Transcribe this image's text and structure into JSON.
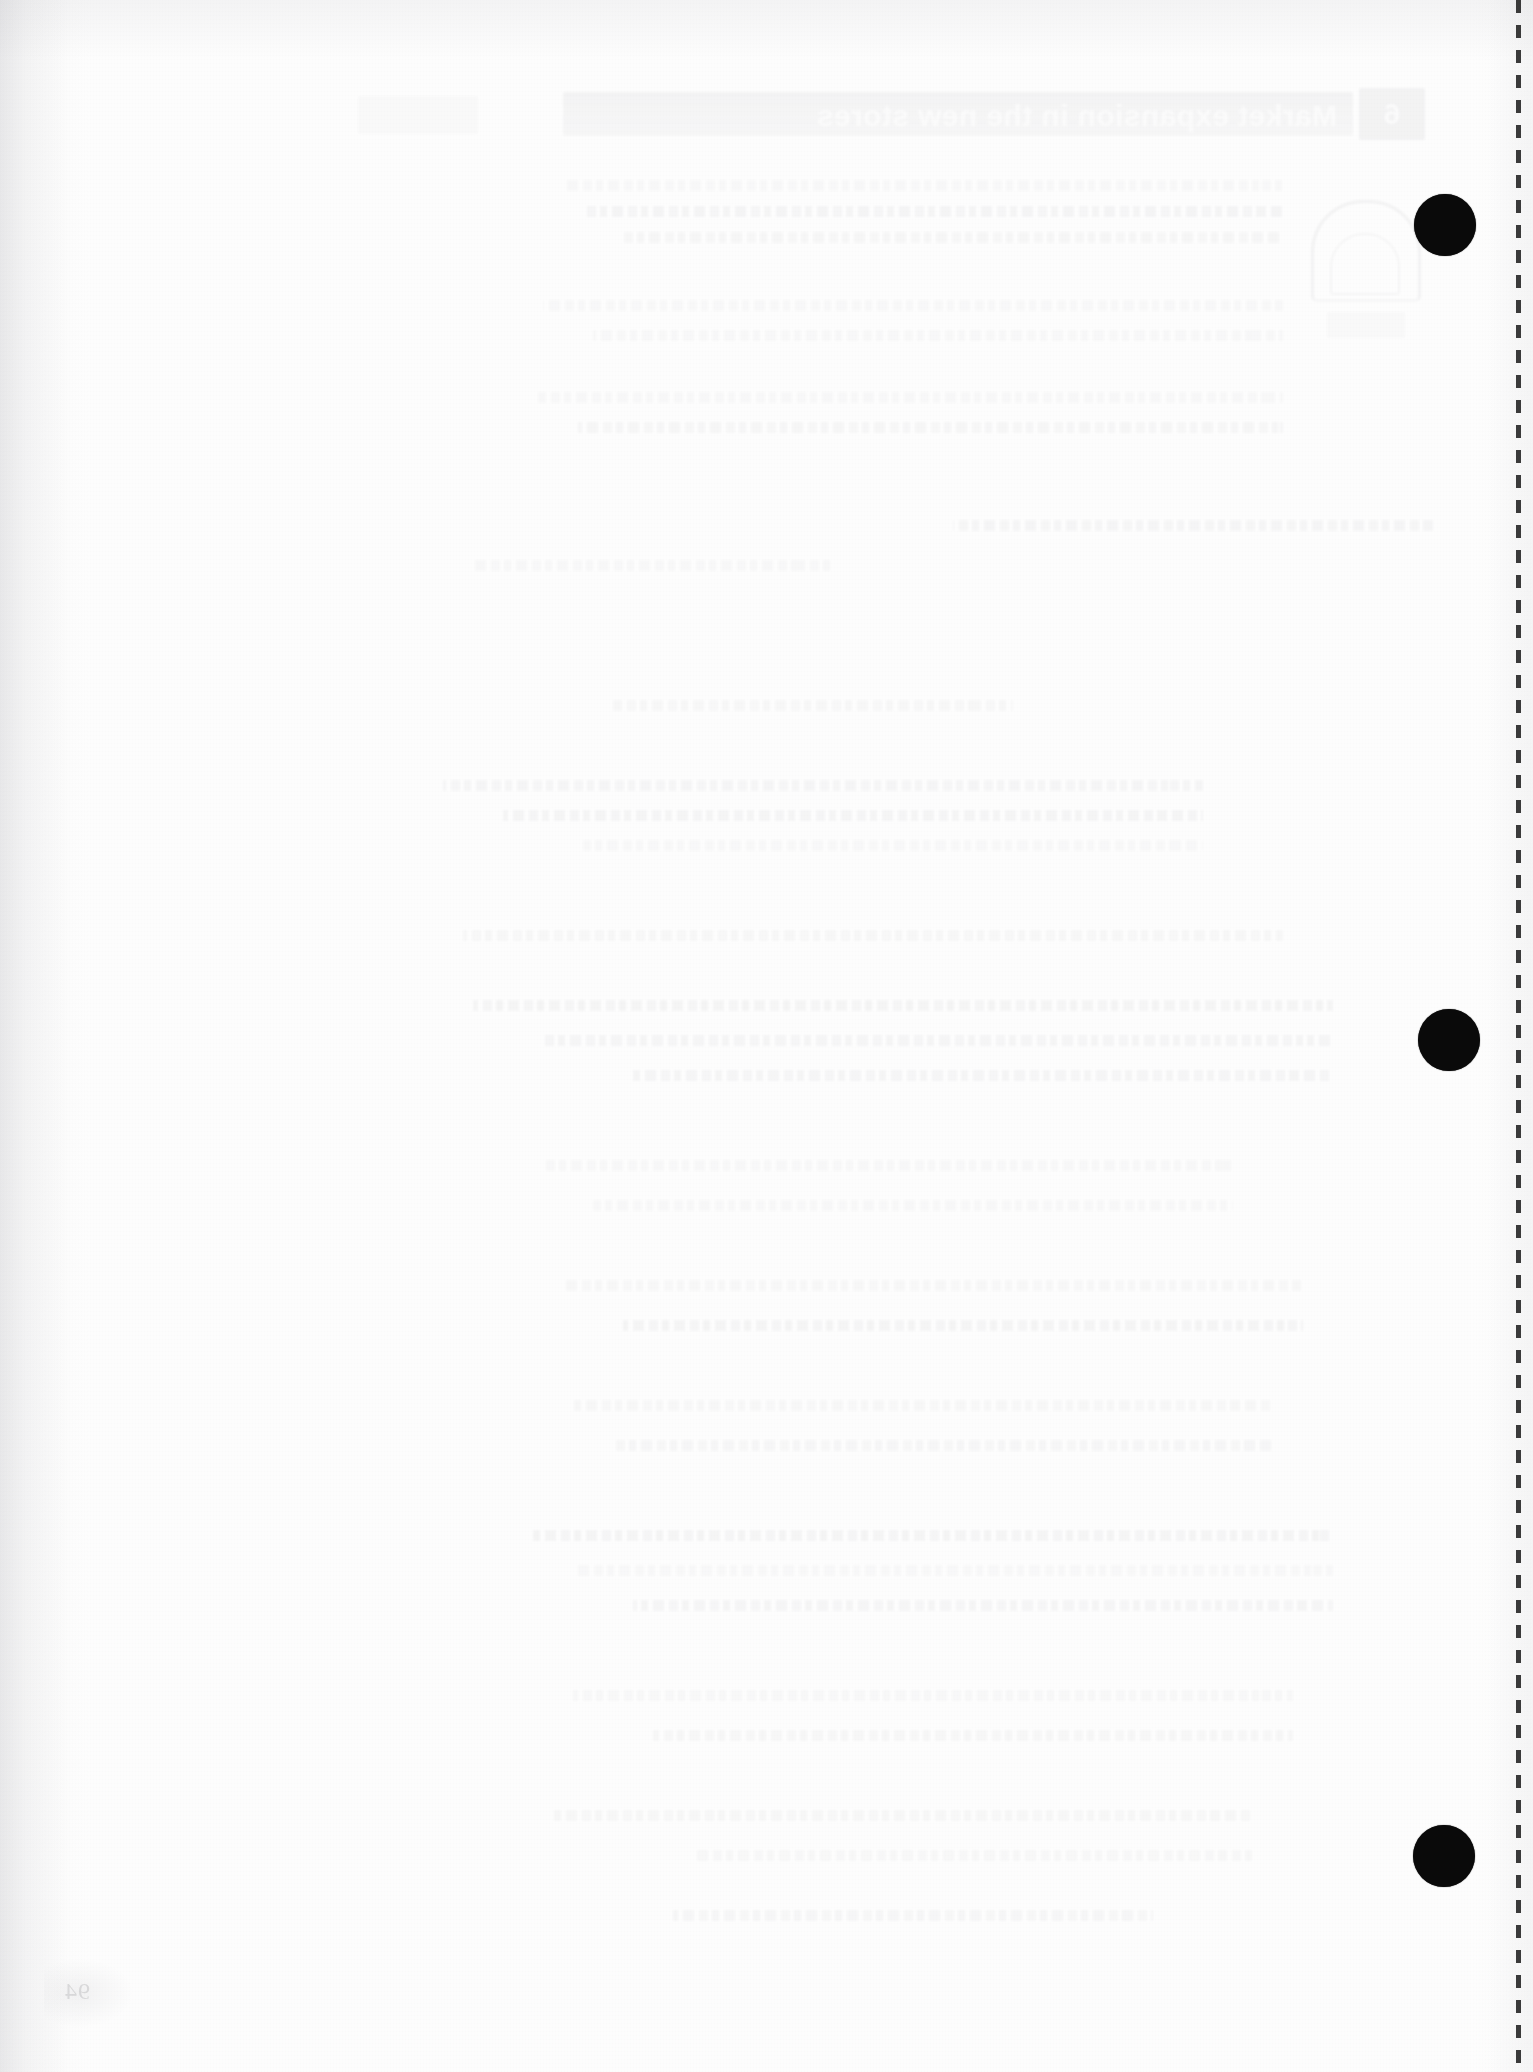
{
  "document": {
    "kind": "scanned-page",
    "surface": "blank-verso-with-show-through",
    "width": 1533,
    "height": 2072,
    "paper_color": "#fdfdfd",
    "ink_color": "#0a0a0a"
  },
  "show_through": {
    "note": "faint mirrored bleed-through from the reverse side of the sheet",
    "opacity": "10%",
    "chapter_number": "6",
    "header_title": "Market expansion in the new stores",
    "graphic": "arch-dome-illustration",
    "body_line_blocks": [
      {
        "top": 180,
        "left": 250,
        "width": 720
      },
      {
        "top": 206,
        "left": 250,
        "width": 700
      },
      {
        "top": 232,
        "left": 250,
        "width": 660
      },
      {
        "top": 300,
        "left": 250,
        "width": 740
      },
      {
        "top": 330,
        "left": 250,
        "width": 690
      },
      {
        "top": 392,
        "left": 250,
        "width": 745
      },
      {
        "top": 422,
        "left": 250,
        "width": 705
      },
      {
        "top": 520,
        "left": 100,
        "width": 480
      },
      {
        "top": 560,
        "left": 700,
        "width": 360
      },
      {
        "top": 700,
        "left": 520,
        "width": 400
      },
      {
        "top": 780,
        "left": 330,
        "width": 760
      },
      {
        "top": 810,
        "left": 330,
        "width": 700
      },
      {
        "top": 840,
        "left": 330,
        "width": 620
      },
      {
        "top": 930,
        "left": 250,
        "width": 820
      },
      {
        "top": 1000,
        "left": 200,
        "width": 860
      },
      {
        "top": 1035,
        "left": 200,
        "width": 790
      },
      {
        "top": 1070,
        "left": 200,
        "width": 700
      },
      {
        "top": 1160,
        "left": 300,
        "width": 690
      },
      {
        "top": 1200,
        "left": 300,
        "width": 640
      },
      {
        "top": 1280,
        "left": 230,
        "width": 740
      },
      {
        "top": 1320,
        "left": 230,
        "width": 680
      },
      {
        "top": 1400,
        "left": 260,
        "width": 700
      },
      {
        "top": 1440,
        "left": 260,
        "width": 660
      },
      {
        "top": 1530,
        "left": 200,
        "width": 800
      },
      {
        "top": 1565,
        "left": 200,
        "width": 760
      },
      {
        "top": 1600,
        "left": 200,
        "width": 700
      },
      {
        "top": 1690,
        "left": 240,
        "width": 720
      },
      {
        "top": 1730,
        "left": 240,
        "width": 640
      },
      {
        "top": 1810,
        "left": 280,
        "width": 700
      },
      {
        "top": 1850,
        "left": 280,
        "width": 560
      },
      {
        "top": 1910,
        "left": 380,
        "width": 480
      }
    ]
  },
  "binder_holes": {
    "label": "three-ring punch holes",
    "radius": 31,
    "color": "#0a0a0a",
    "positions": [
      {
        "cx": 1445,
        "cy": 225
      },
      {
        "cx": 1449,
        "cy": 1040
      },
      {
        "cx": 1444,
        "cy": 1856
      }
    ]
  },
  "perforation": {
    "label": "tear-off perforation line",
    "x": 1516,
    "dash_length": 13,
    "dash_gap": 12,
    "color": "#2a2a2a"
  },
  "page_number": {
    "value": "94",
    "x": 64,
    "y": 1978
  }
}
